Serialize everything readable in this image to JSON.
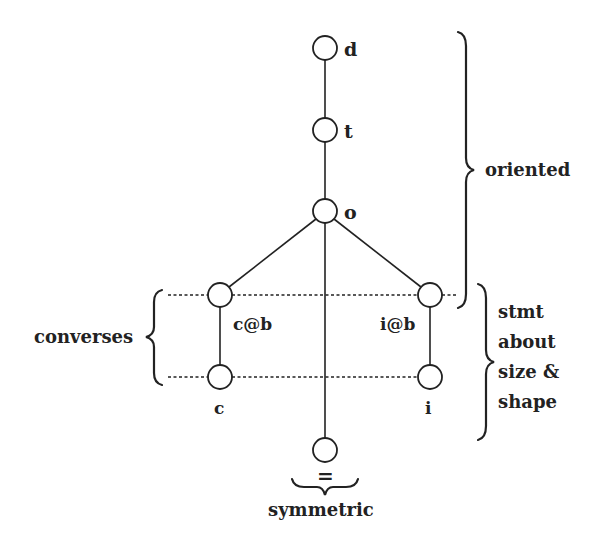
{
  "diagram": {
    "colors": {
      "ink": "#222222",
      "background": "#ffffff"
    },
    "nodes": [
      {
        "id": "d",
        "label": "d",
        "x": 325,
        "y": 48
      },
      {
        "id": "t",
        "label": "t",
        "x": 325,
        "y": 130
      },
      {
        "id": "o",
        "label": "o",
        "x": 325,
        "y": 211
      },
      {
        "id": "cb",
        "label": "c@b",
        "x": 220,
        "y": 295
      },
      {
        "id": "ib",
        "label": "i@b",
        "x": 430,
        "y": 295
      },
      {
        "id": "c",
        "label": "c",
        "x": 220,
        "y": 377
      },
      {
        "id": "i",
        "label": "i",
        "x": 430,
        "y": 377
      },
      {
        "id": "eq",
        "label": "=",
        "x": 325,
        "y": 450
      }
    ],
    "edges": [
      [
        "d",
        "t"
      ],
      [
        "t",
        "o"
      ],
      [
        "o",
        "cb"
      ],
      [
        "o",
        "ib"
      ],
      [
        "o",
        "eq"
      ],
      [
        "cb",
        "c"
      ],
      [
        "ib",
        "i"
      ]
    ],
    "groups": {
      "oriented": "oriented",
      "stmt": [
        "stmt",
        "about",
        "size &",
        "shape"
      ],
      "converses": "converses",
      "symmetric": "symmetric"
    }
  }
}
